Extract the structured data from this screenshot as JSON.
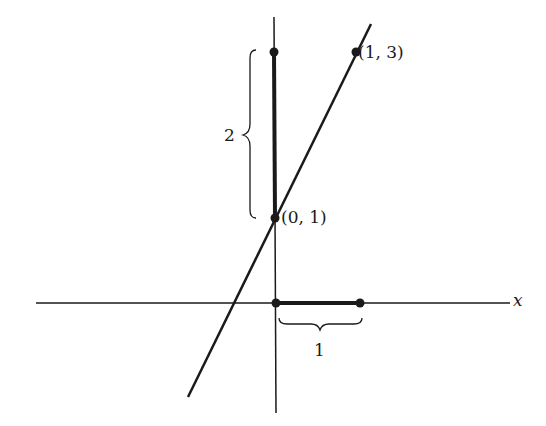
{
  "diagram": {
    "axes": {
      "x_label": "x"
    },
    "points": [
      {
        "label": "(1, 3)"
      },
      {
        "label": "(0, 1)"
      }
    ],
    "braces": {
      "rise_label": "2",
      "run_label": "1"
    },
    "colors": {
      "ink": "#1a1a1a",
      "background": "#ffffff"
    }
  }
}
